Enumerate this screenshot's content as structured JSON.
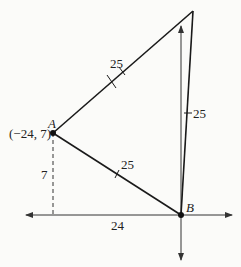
{
  "diagram": {
    "points": {
      "A": {
        "label": "A",
        "coords": "(−24, 7)"
      },
      "B": {
        "label": "B"
      }
    },
    "side_labels": {
      "AC": "25",
      "AB": "25",
      "BC": "25"
    },
    "leg_labels": {
      "vertical": "7",
      "horizontal": "24"
    },
    "colors": {
      "line": "#1a1a1a",
      "axis": "#333333",
      "background": "#fbfbf9"
    }
  }
}
